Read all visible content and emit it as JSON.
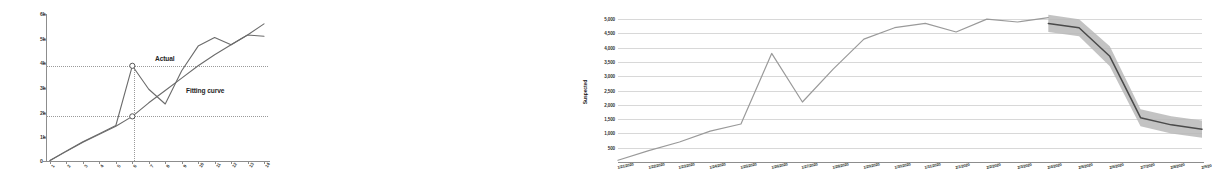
{
  "figure": {
    "panels": [
      "left-fitting-chart",
      "right-suspected-forecast-chart"
    ]
  },
  "chart_data": [
    {
      "id": "left",
      "type": "line",
      "title": "",
      "xlabel": "",
      "ylabel": "",
      "ylim": [
        0,
        6000
      ],
      "yticks": [
        0,
        1000,
        2000,
        3000,
        4000,
        5000,
        6000
      ],
      "ytick_labels": [
        "0",
        "1k",
        "2k",
        "3k",
        "4k",
        "5k",
        "6k"
      ],
      "grid": "dotted-reference-lines-only",
      "reference_lines": {
        "horizontal": [
          3900,
          1850
        ],
        "vertical_at_category": "6"
      },
      "categories": [
        "1",
        "2",
        "3",
        "4",
        "5",
        "6",
        "7",
        "8",
        "9",
        "10",
        "11",
        "12",
        "13",
        "14"
      ],
      "xtick_labels": [
        "1",
        "2",
        "3",
        "4",
        "5",
        "6",
        "7",
        "8",
        "9",
        "10",
        "11",
        "12",
        "13",
        "14"
      ],
      "legend_position": "inline-annotations",
      "series": [
        {
          "name": "Actual",
          "color": "#6b6b6b",
          "values": [
            60,
            450,
            820,
            1150,
            1480,
            3900,
            2950,
            2350,
            3700,
            4700,
            5050,
            4750,
            5150,
            5100
          ],
          "markers": [
            {
              "x_index": 5,
              "y": 3900
            },
            {
              "x_index": 5,
              "y": 1850
            }
          ]
        },
        {
          "name": "Fitting curve",
          "color": "#6b6b6b",
          "values": [
            60,
            430,
            800,
            1120,
            1450,
            1850,
            2400,
            2900,
            3400,
            3900,
            4350,
            4750,
            5150,
            5600
          ]
        }
      ],
      "annotations": [
        {
          "text": "Actual",
          "x_index": 7.4,
          "y": 4650
        },
        {
          "text": "Fitting curve",
          "x_index": 9.6,
          "y": 3150
        }
      ]
    },
    {
      "id": "right",
      "type": "line",
      "title": "",
      "xlabel": "",
      "ylabel": "Suspected",
      "ylim": [
        0,
        5250
      ],
      "yticks": [
        500,
        1000,
        1500,
        2000,
        2500,
        3000,
        3500,
        4000,
        4500,
        5000
      ],
      "ytick_labels": [
        "500",
        "1,000",
        "1,500",
        "2,000",
        "2,500",
        "3,000",
        "3,500",
        "4,000",
        "4,500",
        "5,000"
      ],
      "grid": "horizontal",
      "legend_position": "none",
      "x": [
        "1/21/2020",
        "1/22/2020",
        "1/23/2020",
        "1/24/2020",
        "1/25/2020",
        "1/26/2020",
        "1/27/2020",
        "1/28/2020",
        "1/29/2020",
        "1/30/2020",
        "1/31/2020",
        "2/1/2020",
        "2/2/2020",
        "2/3/2020",
        "2/4/2020",
        "2/5/2020",
        "2/6/2020",
        "2/7/2020",
        "2/8/2020",
        "2/9/20"
      ],
      "xtick_labels": [
        "1/21/2020",
        "1/22/2020",
        "1/23/2020",
        "1/24/2020",
        "1/25/2020",
        "1/26/2020",
        "1/27/2020",
        "1/28/2020",
        "1/29/2020",
        "1/30/2020",
        "1/31/2020",
        "2/1/2020",
        "2/2/2020",
        "2/3/2020",
        "2/4/2020",
        "2/5/2020",
        "2/6/2020",
        "2/7/2020",
        "2/8/2020",
        "2/9/20"
      ],
      "series": [
        {
          "name": "Suspected observed",
          "color": "#9a9a9a",
          "values": [
            60,
            400,
            700,
            1080,
            1330,
            3800,
            2100,
            3250,
            4300,
            4700,
            4850,
            4550,
            5000,
            4900,
            5050,
            null,
            null,
            null,
            null,
            null
          ]
        },
        {
          "name": "Suspected forecast",
          "color": "#4a4a4a",
          "values": [
            null,
            null,
            null,
            null,
            null,
            null,
            null,
            null,
            null,
            null,
            null,
            null,
            null,
            null,
            4850,
            4700,
            3700,
            1550,
            1300,
            1150
          ],
          "band": {
            "fill": "#b8b8b8",
            "upper": [
              null,
              null,
              null,
              null,
              null,
              null,
              null,
              null,
              null,
              null,
              null,
              null,
              null,
              null,
              5150,
              5000,
              4050,
              1850,
              1600,
              1450
            ],
            "lower": [
              null,
              null,
              null,
              null,
              null,
              null,
              null,
              null,
              null,
              null,
              null,
              null,
              null,
              null,
              4550,
              4400,
              3350,
              1250,
              1000,
              850
            ]
          }
        }
      ]
    }
  ],
  "colors": {
    "line_gray": "#6b6b6b",
    "line_light": "#9a9a9a",
    "forecast_line": "#4a4a4a",
    "forecast_band": "#b8b8b8",
    "grid": "#d8d8d8",
    "axis": "#8d8d8d"
  }
}
